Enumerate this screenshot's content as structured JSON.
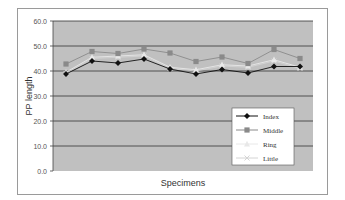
{
  "chart_data": {
    "type": "line",
    "title": "",
    "xlabel": "Specimens",
    "ylabel": "PP length",
    "ylim": [
      0,
      60
    ],
    "yticks": [
      "0.0",
      "10.0",
      "20.0",
      "30.0",
      "40.0",
      "50.0",
      "60.0"
    ],
    "grid": true,
    "legend_position": "lower right inside",
    "categories": [
      "1",
      "2",
      "3",
      "4",
      "5",
      "6",
      "7",
      "8",
      "9",
      "10"
    ],
    "series": [
      {
        "name": "Index",
        "marker": "diamond",
        "color": "#111111",
        "values": [
          38.8,
          44.0,
          43.2,
          44.8,
          40.8,
          38.8,
          40.6,
          39.2,
          41.8,
          41.8
        ]
      },
      {
        "name": "Middle",
        "marker": "square",
        "color": "#8a8a8a",
        "values": [
          42.8,
          47.8,
          47.0,
          48.8,
          47.2,
          43.8,
          45.6,
          43.0,
          48.6,
          45.0
        ]
      },
      {
        "name": "Ring",
        "marker": "triangle",
        "color": "#e8e8e8",
        "values": [
          39.5,
          45.5,
          46.0,
          46.5,
          41.5,
          40.5,
          42.5,
          42.0,
          44.5,
          41.5
        ]
      },
      {
        "name": "Little",
        "marker": "x",
        "color": "#d4d4d4",
        "values": [
          39.0,
          45.0,
          45.5,
          46.0,
          41.0,
          40.0,
          42.0,
          41.5,
          44.0,
          41.0
        ]
      }
    ]
  },
  "colors": {
    "plot_background": "#c0c0c0",
    "gridline": "#333333",
    "frame_border": "#9a9a9a"
  }
}
